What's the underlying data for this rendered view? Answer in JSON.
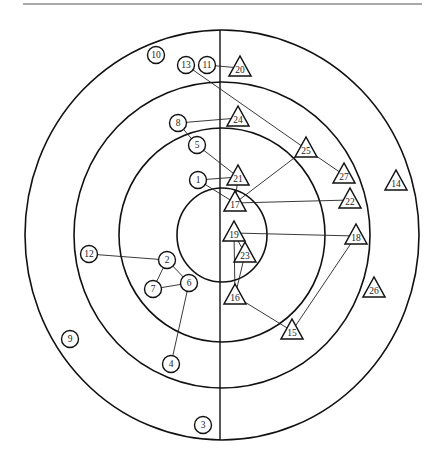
{
  "diagram": {
    "title": "",
    "type": "sociogram",
    "center": [
      222,
      235
    ],
    "rings": [
      {
        "id": "inner",
        "rx": 45,
        "ry": 47
      },
      {
        "id": "ring-2",
        "rx": 103,
        "ry": 107
      },
      {
        "id": "ring-3",
        "rx": 148,
        "ry": 153
      },
      {
        "id": "outer",
        "rx": 197,
        "ry": 205
      }
    ],
    "divider": {
      "x": 220,
      "y1": 30,
      "y2": 440
    },
    "top_rule": {
      "x1": 23,
      "x2": 422,
      "y": 4
    },
    "shape_legend": {
      "circle": "left group",
      "triangle": "right group"
    },
    "nodes": [
      {
        "id": "1",
        "label": "1",
        "shape": "circle",
        "x": 198,
        "y": 180
      },
      {
        "id": "2",
        "label": "2",
        "shape": "circle",
        "x": 167,
        "y": 260
      },
      {
        "id": "3",
        "label": "3",
        "shape": "circle",
        "x": 203,
        "y": 425
      },
      {
        "id": "4",
        "label": "4",
        "shape": "circle",
        "x": 171,
        "y": 364
      },
      {
        "id": "5",
        "label": "5",
        "shape": "circle",
        "x": 197,
        "y": 145
      },
      {
        "id": "6",
        "label": "6",
        "shape": "circle",
        "x": 189,
        "y": 283
      },
      {
        "id": "7",
        "label": "7",
        "shape": "circle",
        "x": 153,
        "y": 289
      },
      {
        "id": "8",
        "label": "8",
        "shape": "circle",
        "x": 178,
        "y": 123
      },
      {
        "id": "9",
        "label": "9",
        "shape": "circle",
        "x": 70,
        "y": 339
      },
      {
        "id": "10",
        "label": "10",
        "shape": "circle",
        "x": 156,
        "y": 55
      },
      {
        "id": "11",
        "label": "11",
        "shape": "circle",
        "x": 207,
        "y": 65
      },
      {
        "id": "12",
        "label": "12",
        "shape": "circle",
        "x": 89,
        "y": 254
      },
      {
        "id": "13",
        "label": "13",
        "shape": "circle",
        "x": 186,
        "y": 65
      },
      {
        "id": "14",
        "label": "14",
        "shape": "triangle",
        "x": 396,
        "y": 182
      },
      {
        "id": "15",
        "label": "15",
        "shape": "triangle",
        "x": 292,
        "y": 331
      },
      {
        "id": "16",
        "label": "16",
        "shape": "triangle",
        "x": 235,
        "y": 296
      },
      {
        "id": "17",
        "label": "17",
        "shape": "triangle",
        "x": 235,
        "y": 203
      },
      {
        "id": "18",
        "label": "18",
        "shape": "triangle",
        "x": 356,
        "y": 236
      },
      {
        "id": "19",
        "label": "19",
        "shape": "triangle",
        "x": 234,
        "y": 233
      },
      {
        "id": "20",
        "label": "20",
        "shape": "triangle",
        "x": 240,
        "y": 68
      },
      {
        "id": "21",
        "label": "21",
        "shape": "triangle",
        "x": 238,
        "y": 177
      },
      {
        "id": "22",
        "label": "22",
        "shape": "triangle",
        "x": 350,
        "y": 200
      },
      {
        "id": "23",
        "label": "23",
        "shape": "triangle",
        "x": 245,
        "y": 254
      },
      {
        "id": "24",
        "label": "24",
        "shape": "triangle",
        "x": 238,
        "y": 118
      },
      {
        "id": "25",
        "label": "25",
        "shape": "triangle",
        "x": 306,
        "y": 149
      },
      {
        "id": "26",
        "label": "26",
        "shape": "triangle",
        "x": 374,
        "y": 289
      },
      {
        "id": "27",
        "label": "27",
        "shape": "triangle",
        "x": 344,
        "y": 175
      }
    ],
    "edges": [
      {
        "from": "11",
        "to": "20"
      },
      {
        "from": "13",
        "to": "25"
      },
      {
        "from": "25",
        "to": "27"
      },
      {
        "from": "25",
        "to": "17"
      },
      {
        "from": "8",
        "to": "24"
      },
      {
        "from": "8",
        "to": "5"
      },
      {
        "from": "5",
        "to": "21"
      },
      {
        "from": "1",
        "to": "21"
      },
      {
        "from": "1",
        "to": "17"
      },
      {
        "from": "21",
        "to": "17"
      },
      {
        "from": "17",
        "to": "22"
      },
      {
        "from": "19",
        "to": "18"
      },
      {
        "from": "19",
        "to": "23"
      },
      {
        "from": "19",
        "to": "16"
      },
      {
        "from": "23",
        "to": "16"
      },
      {
        "from": "16",
        "to": "15"
      },
      {
        "from": "15",
        "to": "18"
      },
      {
        "from": "12",
        "to": "2"
      },
      {
        "from": "2",
        "to": "7"
      },
      {
        "from": "2",
        "to": "6"
      },
      {
        "from": "7",
        "to": "6"
      },
      {
        "from": "6",
        "to": "4"
      }
    ]
  }
}
